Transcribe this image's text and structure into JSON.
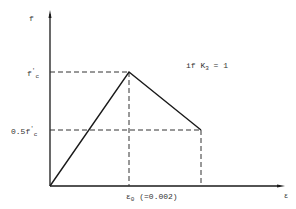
{
  "diagram": {
    "type": "stress-strain curve",
    "y_axis_label": "f",
    "x_axis_label": "ε",
    "peak_label_main": "f",
    "peak_label_prime": "'",
    "peak_label_sub": "c",
    "half_label_main": "0.5f",
    "half_label_prime": "'",
    "half_label_sub": "c",
    "strain_label_main": "ε",
    "strain_label_sub": "0",
    "strain_label_value": " (=0.002)",
    "condition_main": "if K",
    "condition_sub": "3",
    "condition_tail": " = 1",
    "points": [
      {
        "name": "origin",
        "strain": 0,
        "stress": 0
      },
      {
        "name": "peak",
        "strain": "ε0",
        "stress": "f'c"
      },
      {
        "name": "end",
        "strain": "beyond ε0",
        "stress": "0.5f'c"
      }
    ],
    "colors": {
      "line": "#1a1a1a",
      "dash": "#333333"
    }
  }
}
